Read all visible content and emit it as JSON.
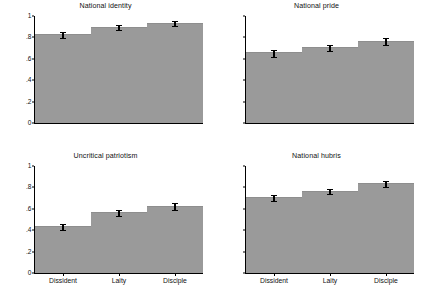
{
  "figure": {
    "bar_color": "#9a9a9a",
    "axis_color": "#000000",
    "background": "#ffffff",
    "panel_count": 4
  },
  "chart_data": [
    {
      "type": "bar",
      "title": "National identity",
      "categories": [
        "Dissident",
        "Laity",
        "Disciple"
      ],
      "values": [
        0.82,
        0.89,
        0.93
      ],
      "error_low": [
        0.795,
        0.868,
        0.908
      ],
      "error_high": [
        0.852,
        0.915,
        0.955
      ],
      "xlabel": "",
      "ylabel": "",
      "ylim": [
        0,
        1
      ],
      "yticks": [
        0,
        0.2,
        0.4,
        0.6,
        0.8,
        1
      ],
      "ytick_labels": [
        "0",
        ".2",
        ".4",
        ".6",
        ".8",
        "1"
      ],
      "grid": false,
      "legend": "none",
      "panel_position": "top-left",
      "show_ylabels": true,
      "show_xlabels": false
    },
    {
      "type": "bar",
      "title": "National pride",
      "categories": [
        "Dissident",
        "Laity",
        "Disciple"
      ],
      "values": [
        0.65,
        0.7,
        0.76
      ],
      "error_low": [
        0.618,
        0.675,
        0.728
      ],
      "error_high": [
        0.682,
        0.727,
        0.795
      ],
      "xlabel": "",
      "ylabel": "",
      "ylim": [
        0,
        1
      ],
      "yticks": [
        0,
        0.2,
        0.4,
        0.6,
        0.8,
        1
      ],
      "ytick_labels": [
        "0",
        ".2",
        ".4",
        ".6",
        ".8",
        "1"
      ],
      "grid": false,
      "legend": "none",
      "panel_position": "top-right",
      "show_ylabels": false,
      "show_xlabels": false
    },
    {
      "type": "bar",
      "title": "Uncritical patriotism",
      "categories": [
        "Dissident",
        "Laity",
        "Disciple"
      ],
      "values": [
        0.43,
        0.56,
        0.62
      ],
      "error_low": [
        0.402,
        0.535,
        0.588
      ],
      "error_high": [
        0.462,
        0.587,
        0.658
      ],
      "xlabel": "",
      "ylabel": "",
      "ylim": [
        0,
        1
      ],
      "yticks": [
        0,
        0.2,
        0.4,
        0.6,
        0.8,
        1
      ],
      "ytick_labels": [
        "0",
        ".2",
        ".4",
        ".6",
        ".8",
        "1"
      ],
      "grid": false,
      "legend": "none",
      "panel_position": "bottom-left",
      "show_ylabels": true,
      "show_xlabels": true
    },
    {
      "type": "bar",
      "title": "National hubris",
      "categories": [
        "Dissident",
        "Laity",
        "Disciple"
      ],
      "values": [
        0.7,
        0.76,
        0.83
      ],
      "error_low": [
        0.672,
        0.735,
        0.8
      ],
      "error_high": [
        0.73,
        0.788,
        0.862
      ],
      "xlabel": "",
      "ylabel": "",
      "ylim": [
        0,
        1
      ],
      "yticks": [
        0,
        0.2,
        0.4,
        0.6,
        0.8,
        1
      ],
      "ytick_labels": [
        "0",
        ".2",
        ".4",
        ".6",
        ".8",
        "1"
      ],
      "grid": false,
      "legend": "none",
      "panel_position": "bottom-right",
      "show_ylabels": false,
      "show_xlabels": true
    }
  ]
}
